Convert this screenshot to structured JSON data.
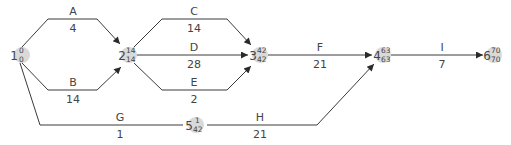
{
  "diagram": {
    "type": "activity-on-arrow network",
    "colors": {
      "edge": "#3a3a3a",
      "node_fill": "#d9d9d9",
      "text": "#444444"
    },
    "nodes": [
      {
        "id": "1",
        "early": "0",
        "late": "0"
      },
      {
        "id": "2",
        "early": "14",
        "late": "14"
      },
      {
        "id": "3",
        "early": "42",
        "late": "42"
      },
      {
        "id": "4",
        "early": "63",
        "late": "63"
      },
      {
        "id": "5",
        "early": "1",
        "late": "42"
      },
      {
        "id": "6",
        "early": "70",
        "late": "70"
      }
    ],
    "activities": [
      {
        "name": "A",
        "duration": "4",
        "from": "1",
        "to": "2"
      },
      {
        "name": "B",
        "duration": "14",
        "from": "1",
        "to": "2"
      },
      {
        "name": "C",
        "duration": "14",
        "from": "2",
        "to": "3"
      },
      {
        "name": "D",
        "duration": "28",
        "from": "2",
        "to": "3"
      },
      {
        "name": "E",
        "duration": "2",
        "from": "2",
        "to": "3"
      },
      {
        "name": "F",
        "duration": "21",
        "from": "3",
        "to": "4"
      },
      {
        "name": "G",
        "duration": "1",
        "from": "1",
        "to": "5"
      },
      {
        "name": "H",
        "duration": "21",
        "from": "5",
        "to": "4"
      },
      {
        "name": "I",
        "duration": "7",
        "from": "4",
        "to": "6"
      }
    ]
  }
}
